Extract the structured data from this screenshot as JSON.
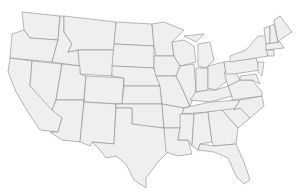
{
  "map": {
    "title": "",
    "region": "United States (contiguous)",
    "fill_color": "#efefef",
    "border_color": "#8a8a8a",
    "background": "#ffffff",
    "states": [
      {
        "id": "WA",
        "d": "M22,12 L60,16 L58,40 L30,38 L24,30 Z"
      },
      {
        "id": "OR",
        "d": "M12,34 L24,30 L30,38 L58,40 L52,62 L10,58 Z"
      },
      {
        "id": "CA",
        "d": "M10,58 L32,61 L30,86 L62,118 L58,132 L40,130 L28,112 L16,92 L8,72 Z"
      },
      {
        "id": "ID",
        "d": "M60,16 L64,16 L64,32 L72,44 L68,52 L78,50 L80,66 L52,62 L58,40 Z"
      },
      {
        "id": "NV",
        "d": "M32,61 L62,64 L56,100 L52,110 L30,86 Z"
      },
      {
        "id": "MT",
        "d": "M64,16 L116,22 L114,50 L78,50 L68,52 L72,44 L64,32 Z"
      },
      {
        "id": "WY",
        "d": "M78,50 L114,50 L112,76 L80,74 Z"
      },
      {
        "id": "UT",
        "d": "M62,64 L80,66 L80,74 L86,76 L84,100 L56,100 Z"
      },
      {
        "id": "AZ",
        "d": "M56,100 L84,100 L80,142 L62,140 L50,132 L58,132 L62,118 L52,110 Z"
      },
      {
        "id": "CO",
        "d": "M86,76 L124,78 L122,104 L84,102 Z"
      },
      {
        "id": "NM",
        "d": "M84,102 L116,104 L114,144 L92,142 L90,146 L80,142 Z"
      },
      {
        "id": "ND",
        "d": "M116,22 L152,24 L154,46 L114,44 Z"
      },
      {
        "id": "SD",
        "d": "M114,44 L154,46 L154,68 L112,66 Z"
      },
      {
        "id": "NE",
        "d": "M112,66 L154,68 L160,86 L124,86 L124,78 L112,76 Z"
      },
      {
        "id": "KS",
        "d": "M124,86 L160,86 L162,104 L122,104 Z"
      },
      {
        "id": "OK",
        "d": "M116,104 L162,104 L164,128 L144,126 L132,124 L132,108 L116,108 Z"
      },
      {
        "id": "TX",
        "d": "M116,108 L132,108 L132,124 L164,128 L168,152 L158,162 L146,178 L146,188 L134,180 L126,164 L116,156 L106,158 L100,150 L92,142 L114,144 Z"
      },
      {
        "id": "MN",
        "d": "M152,24 L164,22 L184,30 L172,42 L174,56 L156,56 L154,46 Z"
      },
      {
        "id": "IA",
        "d": "M154,56 L174,56 L180,66 L176,76 L156,76 L154,68 Z"
      },
      {
        "id": "MO",
        "d": "M156,76 L176,76 L182,88 L190,106 L184,108 L162,104 L160,86 Z"
      },
      {
        "id": "AR",
        "d": "M162,104 L184,108 L180,128 L164,128 Z"
      },
      {
        "id": "LA",
        "d": "M164,128 L180,128 L178,140 L188,140 L192,154 L178,156 L166,152 Z"
      },
      {
        "id": "WI",
        "d": "M172,42 L184,40 L194,46 L196,62 L180,66 L174,56 Z"
      },
      {
        "id": "IL",
        "d": "M180,66 L194,64 L196,92 L190,106 L182,88 L176,76 Z"
      },
      {
        "id": "MI",
        "d": "M198,44 L210,42 L214,60 L206,68 L198,66 Z M184,36 L204,34 L196,42 Z"
      },
      {
        "id": "IN",
        "d": "M196,68 L208,68 L208,90 L196,92 Z"
      },
      {
        "id": "OH",
        "d": "M208,66 L224,62 L228,80 L216,90 L208,88 Z"
      },
      {
        "id": "KY",
        "d": "M190,100 L196,92 L208,90 L216,90 L228,86 L232,96 L210,102 Z"
      },
      {
        "id": "TN",
        "d": "M184,108 L210,102 L240,100 L234,110 L182,114 Z"
      },
      {
        "id": "MS",
        "d": "M180,114 L194,114 L192,146 L188,140 L178,140 L180,128 Z"
      },
      {
        "id": "AL",
        "d": "M194,114 L208,112 L212,142 L200,144 L198,150 L192,146 Z"
      },
      {
        "id": "GA",
        "d": "M208,112 L222,110 L238,128 L236,144 L214,146 L212,142 Z"
      },
      {
        "id": "FL",
        "d": "M198,150 L200,144 L214,146 L236,144 L244,162 L250,180 L244,184 L236,176 L228,158 L214,152 Z"
      },
      {
        "id": "SC",
        "d": "M222,110 L240,108 L250,118 L238,128 Z"
      },
      {
        "id": "NC",
        "d": "M234,110 L240,100 L262,96 L264,106 L250,118 L240,108 Z"
      },
      {
        "id": "VA",
        "d": "M228,86 L240,80 L252,80 L262,92 L262,96 L232,100 L232,96 Z"
      },
      {
        "id": "WV",
        "d": "M224,72 L234,70 L240,80 L228,86 L226,80 Z"
      },
      {
        "id": "PA",
        "d": "M224,62 L256,58 L260,70 L234,74 L226,74 Z"
      },
      {
        "id": "NY",
        "d": "M230,56 L246,50 L258,36 L266,36 L268,56 L256,58 L230,62 Z"
      },
      {
        "id": "NJ",
        "d": "M258,62 L264,62 L262,76 L258,72 Z"
      },
      {
        "id": "MD",
        "d": "M240,76 L256,74 L260,84 L252,80 L240,80 Z"
      },
      {
        "id": "VT",
        "d": "M264,28 L270,26 L270,44 L266,44 Z"
      },
      {
        "id": "NH",
        "d": "M270,26 L274,24 L278,42 L270,44 Z"
      },
      {
        "id": "ME",
        "d": "M274,20 L280,16 L286,24 L292,32 L280,40 L278,42 Z"
      },
      {
        "id": "MA",
        "d": "M266,44 L280,42 L284,48 L266,50 Z"
      },
      {
        "id": "CT",
        "d": "M266,50 L274,50 L274,56 L268,56 Z"
      }
    ]
  }
}
